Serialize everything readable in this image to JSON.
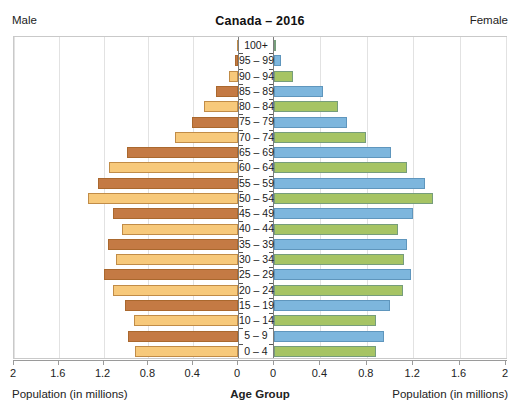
{
  "header": {
    "left_label": "Male",
    "right_label": "Female",
    "title": "Canada – 2016"
  },
  "axis": {
    "left_title": "Population (in millions)",
    "center_title": "Age Group",
    "right_title": "Population (in millions)",
    "left_ticks": [
      "2",
      "1.6",
      "1.2",
      "0.8",
      "0.4",
      "0"
    ],
    "right_ticks": [
      "0",
      "0.4",
      "0.8",
      "1.2",
      "1.6",
      "2"
    ],
    "max": 2,
    "tick_step": 0.4
  },
  "colors": {
    "male_dark": "#c47a44",
    "male_light": "#f7c97b",
    "female_blue": "#7db6dd",
    "female_green": "#a6c464",
    "frame": "#c9c9c9",
    "grid": "#e2e2e2",
    "center_rule": "#7d7d7d",
    "axis": "#9a9a9a"
  },
  "chart_data": {
    "type": "bar",
    "title": "Canada – 2016",
    "subtitle": "",
    "xlabel": "Population (in millions)",
    "ylabel": "Age Group",
    "xlim": [
      0,
      2
    ],
    "grid": true,
    "legend_position": "top-corners",
    "orientation": "population-pyramid",
    "categories": [
      "100+",
      "95 – 99",
      "90 – 94",
      "85 – 89",
      "80 – 84",
      "75 – 79",
      "70 – 74",
      "65 – 69",
      "60 – 64",
      "55 – 59",
      "50 – 54",
      "45 – 49",
      "40 – 44",
      "35 – 39",
      "30 – 34",
      "25 – 29",
      "20 – 24",
      "15 – 19",
      "10 – 14",
      "5 – 9",
      "0 – 4"
    ],
    "series": [
      {
        "name": "Male",
        "side": "left",
        "values": [
          0.01,
          0.03,
          0.08,
          0.2,
          0.3,
          0.41,
          0.56,
          0.99,
          1.15,
          1.25,
          1.34,
          1.12,
          1.04,
          1.16,
          1.09,
          1.2,
          1.12,
          1.01,
          0.93,
          0.98,
          0.92
        ]
      },
      {
        "name": "Female",
        "side": "right",
        "values": [
          0.02,
          0.06,
          0.16,
          0.42,
          0.55,
          0.63,
          0.79,
          1.01,
          1.15,
          1.3,
          1.37,
          1.2,
          1.07,
          1.15,
          1.12,
          1.18,
          1.11,
          1.0,
          0.88,
          0.95,
          0.88
        ]
      }
    ]
  }
}
